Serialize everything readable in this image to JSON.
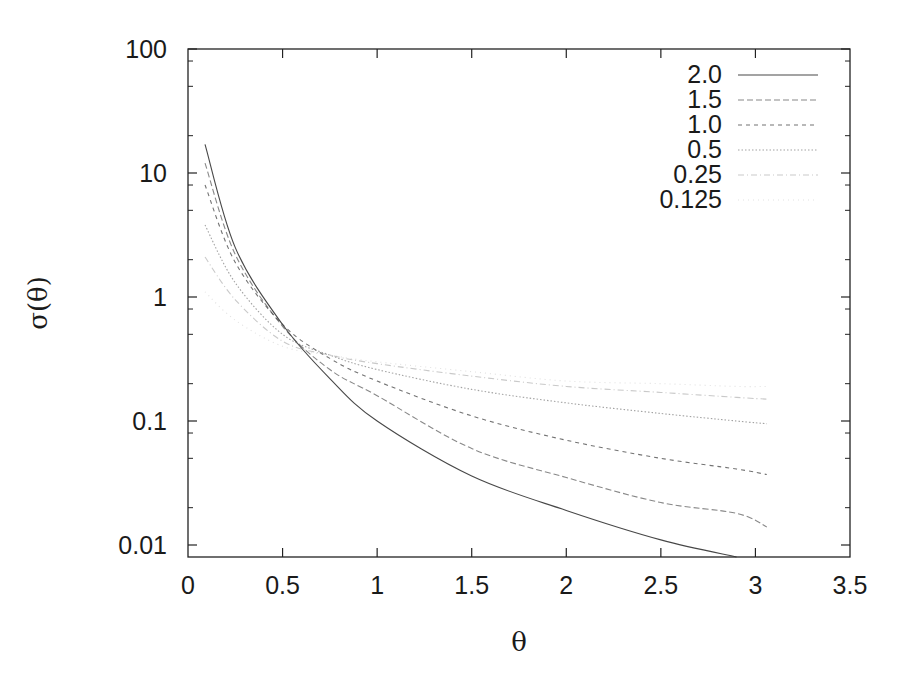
{
  "chart_data": {
    "type": "line",
    "title": "",
    "xlabel": "θ",
    "ylabel": "σ(θ)",
    "xlim": [
      0,
      3.5
    ],
    "ylim": [
      0.008,
      100
    ],
    "yscale": "log",
    "grid": false,
    "legend_position": "upper right",
    "x_ticks": [
      0,
      0.5,
      1,
      1.5,
      2,
      2.5,
      3,
      3.5
    ],
    "x_tick_labels": [
      "0",
      "0.5",
      "1",
      "1.5",
      "2",
      "2.5",
      "3",
      "3.5"
    ],
    "y_ticks": [
      100,
      10,
      1,
      0.1,
      0.01
    ],
    "y_tick_labels": [
      "100",
      "10",
      "1",
      "0.1",
      "0.01"
    ],
    "x": [
      0.09,
      0.25,
      0.5,
      0.75,
      1.0,
      1.5,
      2.0,
      2.5,
      2.9,
      3.06
    ],
    "series": [
      {
        "name": "2.0",
        "color": "#333333",
        "dash": "",
        "opacity": 0.9,
        "values": [
          17,
          2.5,
          0.6,
          0.22,
          0.1,
          0.036,
          0.019,
          0.011,
          0.008,
          null
        ]
      },
      {
        "name": "1.5",
        "color": "#555555",
        "dash": "6,3",
        "opacity": 0.7,
        "values": [
          12,
          2.2,
          0.58,
          0.26,
          0.16,
          0.06,
          0.035,
          0.022,
          0.018,
          0.014
        ]
      },
      {
        "name": "1.0",
        "color": "#444444",
        "dash": "4,4",
        "opacity": 0.75,
        "values": [
          8,
          1.9,
          0.6,
          0.32,
          0.21,
          0.11,
          0.07,
          0.05,
          0.041,
          0.037
        ]
      },
      {
        "name": "0.5",
        "color": "#666666",
        "dash": "1.5,2",
        "opacity": 0.6,
        "values": [
          3.8,
          1.3,
          0.5,
          0.34,
          0.26,
          0.18,
          0.14,
          0.115,
          0.1,
          0.095
        ]
      },
      {
        "name": "0.25",
        "color": "#888888",
        "dash": "6,3,1,3",
        "opacity": 0.45,
        "values": [
          2.1,
          0.95,
          0.44,
          0.34,
          0.29,
          0.23,
          0.19,
          0.17,
          0.155,
          0.15
        ]
      },
      {
        "name": "0.125",
        "color": "#aaaaaa",
        "dash": "1,4",
        "opacity": 0.35,
        "values": [
          1.1,
          0.65,
          0.4,
          0.34,
          0.3,
          0.25,
          0.21,
          0.2,
          0.19,
          0.19
        ]
      }
    ]
  },
  "legend": {
    "items": [
      "2.0",
      "1.5",
      "1.0",
      "0.5",
      "0.25",
      "0.125"
    ]
  },
  "axes": {
    "xlabel": "θ",
    "ylabel": "σ(θ)"
  }
}
